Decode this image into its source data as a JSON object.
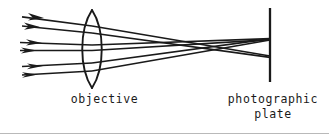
{
  "figure": {
    "background_color": "#ffffff",
    "ink_color": "#1a1a1a",
    "rule_color": "#b9b9b9",
    "width": 329,
    "height": 136,
    "labels": {
      "objective": "objective",
      "plate_line1": "photographic",
      "plate_line2": "plate"
    },
    "lens": {
      "name": "objective",
      "type": "biconvex",
      "center_x": 92,
      "top_y": 10,
      "bottom_y": 88,
      "half_width": 13,
      "left_surface_x": 79,
      "right_surface_x": 105
    },
    "plate": {
      "name": "photographic plate",
      "x": 270,
      "top_y": 8,
      "bottom_y": 82,
      "thickness": 2.2
    },
    "focal_points": [
      {
        "id": "upper-focus",
        "x": 270,
        "y": 38
      },
      {
        "id": "lower-focus",
        "x": 270,
        "y": 56
      }
    ],
    "ray_bundles": [
      {
        "id": "upper-bundle",
        "arrow_x": 38,
        "converges_to": "lower-focus",
        "rays": [
          {
            "id": "ray-1",
            "start_x": 16,
            "start_y": 16,
            "lens_y": 24,
            "focus_y": 56
          },
          {
            "id": "ray-2",
            "start_x": 16,
            "start_y": 25,
            "lens_y": 31,
            "focus_y": 56
          }
        ]
      },
      {
        "id": "middle-bundle",
        "arrow_x": 38,
        "converges_to": "upper-focus",
        "rays": [
          {
            "id": "ray-3",
            "start_x": 14,
            "start_y": 42,
            "lens_y": 44,
            "focus_y": 38
          },
          {
            "id": "ray-4",
            "start_x": 14,
            "start_y": 50,
            "lens_y": 50,
            "focus_y": 38
          }
        ]
      },
      {
        "id": "lower-bundle",
        "arrow_x": 38,
        "converges_to": "upper-focus",
        "rays": [
          {
            "id": "ray-5",
            "start_x": 16,
            "start_y": 66,
            "lens_y": 62,
            "focus_y": 38
          },
          {
            "id": "ray-6",
            "start_x": 16,
            "start_y": 75,
            "lens_y": 70,
            "focus_y": 38
          }
        ]
      }
    ],
    "arrowheads": 6,
    "ray_count": 6
  }
}
